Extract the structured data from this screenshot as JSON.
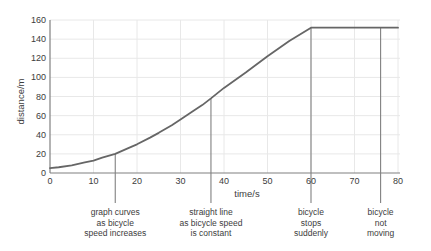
{
  "chart_data": {
    "type": "line",
    "title": "",
    "xlabel": "time/s",
    "ylabel": "distance/m",
    "xlim": [
      0,
      80
    ],
    "ylim": [
      0,
      160
    ],
    "xticks": [
      0,
      10,
      20,
      30,
      40,
      50,
      60,
      70,
      80
    ],
    "yticks": [
      0,
      20,
      40,
      60,
      80,
      100,
      120,
      140,
      160
    ],
    "grid": true,
    "legend": "none",
    "series": [
      {
        "name": "distance travelled by bicycle",
        "color": "#666666",
        "x": [
          0,
          2,
          5,
          8,
          10,
          12,
          15,
          18,
          20,
          23,
          25,
          28,
          30,
          33,
          35,
          37,
          40,
          45,
          50,
          55,
          60,
          65,
          70,
          76,
          80
        ],
        "y": [
          5,
          6,
          8,
          11,
          13,
          16,
          20,
          26,
          30,
          37,
          42,
          50,
          56,
          65,
          71,
          78,
          89,
          105,
          122,
          138,
          152,
          152,
          152,
          152,
          152
        ]
      }
    ],
    "annotations": [
      {
        "id": "curve-region",
        "x": 15,
        "pointer_y_top": 20,
        "lines": [
          "graph curves",
          "as bicycle",
          "speed increases"
        ]
      },
      {
        "id": "straight-region",
        "x": 37,
        "pointer_y_top": 78,
        "lines": [
          "straight line",
          "as bicycle speed",
          "is constant"
        ]
      },
      {
        "id": "stop-point",
        "x": 60,
        "pointer_y_top": 152,
        "lines": [
          "bicycle",
          "stops",
          "suddenly"
        ]
      },
      {
        "id": "stationary-region",
        "x": 76,
        "pointer_y_top": 152,
        "lines": [
          "bicycle",
          "not",
          "moving"
        ]
      }
    ],
    "colors": {
      "curve": "#666666",
      "axis": "#808080",
      "grid": "#e8e8e8",
      "text": "#3c3c3c",
      "background": "#ffffff"
    }
  }
}
